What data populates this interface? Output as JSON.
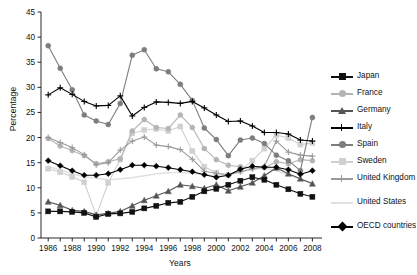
{
  "chart_data": {
    "type": "line",
    "title": "",
    "xlabel": "Years",
    "ylabel": "Percentage",
    "xlim": [
      1985.4,
      2008.8
    ],
    "ylim": [
      0,
      45
    ],
    "ytick_step": 5,
    "yticks": [
      0,
      5,
      10,
      15,
      20,
      25,
      30,
      35,
      40,
      45
    ],
    "xticks_labeled": [
      1986,
      1988,
      1990,
      1992,
      1994,
      1996,
      1998,
      2000,
      2002,
      2004,
      2006,
      2008
    ],
    "xticks_minor": [
      1987,
      1989,
      1991,
      1993,
      1995,
      1997,
      1999,
      2001,
      2003,
      2005,
      2007
    ],
    "grid": false,
    "legend_position": "right",
    "x": [
      1986,
      1987,
      1988,
      1989,
      1990,
      1991,
      1992,
      1993,
      1994,
      1995,
      1996,
      1997,
      1998,
      1999,
      2000,
      2001,
      2002,
      2003,
      2004,
      2005,
      2006,
      2007,
      2008
    ],
    "series": [
      {
        "name": "Japan",
        "color": "#111111",
        "marker": "square",
        "values": [
          5.3,
          5.3,
          5.2,
          5.0,
          4.2,
          4.8,
          4.9,
          5.2,
          5.9,
          6.4,
          7.0,
          7.2,
          8.2,
          9.3,
          9.8,
          10.6,
          11.4,
          12.1,
          11.6,
          10.6,
          9.7,
          8.8,
          8.2
        ]
      },
      {
        "name": "France",
        "color": "#b4b4b4",
        "marker": "circle",
        "values": [
          19.8,
          18.3,
          17.4,
          16.4,
          14.8,
          15.2,
          15.8,
          21.3,
          23.6,
          22.0,
          21.8,
          24.5,
          22.0,
          17.8,
          15.6,
          14.5,
          14.2,
          13.9,
          14.0,
          15.2,
          14.8,
          15.6,
          15.4
        ]
      },
      {
        "name": "Germany",
        "color": "#555555",
        "marker": "triangle",
        "values": [
          7.2,
          6.5,
          5.5,
          5.3,
          4.6,
          4.9,
          5.3,
          6.4,
          7.5,
          8.4,
          9.3,
          10.6,
          10.3,
          9.9,
          10.6,
          9.4,
          10.2,
          11.0,
          12.4,
          14.0,
          12.8,
          11.8,
          10.8
        ]
      },
      {
        "name": "Italy",
        "color": "#000000",
        "marker": "plus",
        "values": [
          28.5,
          29.9,
          28.6,
          27.2,
          26.3,
          26.4,
          28.3,
          24.3,
          26.0,
          27.1,
          27.0,
          26.8,
          27.2,
          25.9,
          24.5,
          23.2,
          23.3,
          22.3,
          21.0,
          21.0,
          20.7,
          19.5,
          19.3
        ]
      },
      {
        "name": "Spain",
        "color": "#7d7d7d",
        "marker": "circle",
        "values": [
          38.3,
          33.8,
          29.5,
          24.5,
          23.3,
          22.6,
          26.8,
          36.4,
          37.5,
          33.7,
          33.1,
          30.6,
          27.4,
          21.9,
          19.6,
          16.4,
          19.5,
          19.9,
          18.8,
          16.5,
          15.4,
          13.4,
          24.0
        ]
      },
      {
        "name": "Sweden",
        "color": "#d0d0d0",
        "marker": "square",
        "values": [
          13.8,
          13.1,
          12.2,
          11.1,
          4.5,
          11.0,
          15.6,
          20.8,
          21.5,
          21.7,
          21.3,
          22.2,
          17.3,
          14.2,
          13.0,
          12.5,
          13.4,
          15.4,
          17.8,
          20.5,
          19.9,
          18.6,
          18.9
        ]
      },
      {
        "name": "United Kingdom",
        "color": "#9a9a9a",
        "marker": "plus",
        "values": [
          20.0,
          19.0,
          18.0,
          16.6,
          14.6,
          15.0,
          17.5,
          19.3,
          20.1,
          18.5,
          18.2,
          17.6,
          15.7,
          13.3,
          12.9,
          12.6,
          13.2,
          13.8,
          14.3,
          19.3,
          17.1,
          16.5,
          16.3
        ]
      },
      {
        "name": "United States",
        "color": "#e0e0e0",
        "marker": "none",
        "values": [
          14.2,
          13.6,
          12.8,
          12.2,
          11.9,
          11.6,
          11.8,
          12.0,
          12.4,
          12.8,
          13.0,
          13.1,
          12.9,
          12.6,
          12.4,
          12.7,
          13.2,
          13.6,
          14.0,
          13.4,
          12.6,
          11.7,
          10.9
        ]
      },
      {
        "name": "OECD countries",
        "color": "#000000",
        "marker": "diamond",
        "values": [
          15.4,
          14.4,
          13.4,
          12.5,
          12.5,
          12.8,
          13.6,
          14.5,
          14.5,
          14.3,
          14.0,
          13.6,
          13.2,
          12.6,
          12.1,
          12.5,
          13.7,
          14.3,
          14.1,
          14.1,
          13.6,
          12.7,
          13.4
        ]
      }
    ]
  },
  "legend": {
    "items": [
      {
        "label": "Japan"
      },
      {
        "label": "France"
      },
      {
        "label": "Germany"
      },
      {
        "label": "Italy"
      },
      {
        "label": "Spain"
      },
      {
        "label": "Sweden"
      },
      {
        "label": "United Kingdom"
      },
      {
        "label": "United States"
      },
      {
        "label": "OECD countries"
      }
    ]
  }
}
